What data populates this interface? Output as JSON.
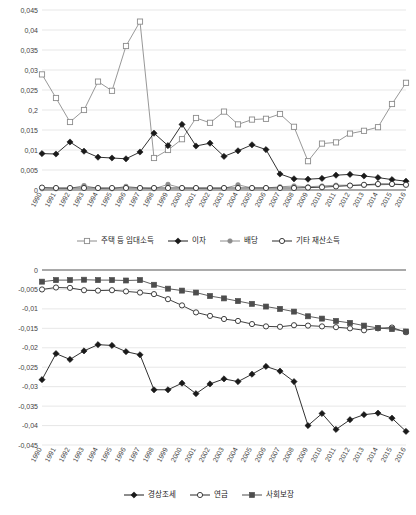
{
  "chart_data": [
    {
      "type": "line",
      "id": "property-income",
      "title": "",
      "xlabel": "",
      "ylabel": "",
      "grid": true,
      "legend_position": "bottom",
      "ylim": [
        0,
        0.045
      ],
      "ytick_values": [
        0,
        0.005,
        0.01,
        0.015,
        0.02,
        0.025,
        0.03,
        0.035,
        0.04,
        0.045
      ],
      "ytick_labels": [
        "0",
        "0,005",
        "0,01",
        "0,015",
        "0,2",
        "0,025",
        "0,03",
        "0,035",
        "0,04",
        "0,045"
      ],
      "categories": [
        "1990",
        "1991",
        "1992",
        "1993",
        "1994",
        "1995",
        "1996",
        "1997",
        "1998",
        "1999",
        "2000",
        "2001",
        "2002",
        "2003",
        "2004",
        "2005",
        "2006",
        "2007",
        "2008",
        "2009",
        "2010",
        "2011",
        "2012",
        "2013",
        "2014",
        "2015",
        "2016"
      ],
      "series": [
        {
          "name": "주택 등 임대소득",
          "marker": "open-square",
          "color": "#8c8c8c",
          "values": [
            0.0289,
            0.023,
            0.017,
            0.02,
            0.0271,
            0.0248,
            0.036,
            0.0421,
            0.008,
            0.01,
            0.0127,
            0.018,
            0.0168,
            0.0196,
            0.0164,
            0.0176,
            0.0178,
            0.019,
            0.0158,
            0.0072,
            0.0116,
            0.0119,
            0.0141,
            0.0148,
            0.0157,
            0.0215,
            0.0268
          ]
        },
        {
          "name": "이자",
          "marker": "filled-diamond",
          "color": "#1a1a1a",
          "values": [
            0.0091,
            0.009,
            0.012,
            0.0097,
            0.0082,
            0.008,
            0.0078,
            0.0095,
            0.0142,
            0.0111,
            0.0164,
            0.011,
            0.0117,
            0.0084,
            0.0098,
            0.0113,
            0.0101,
            0.004,
            0.0028,
            0.0027,
            0.0029,
            0.0037,
            0.0039,
            0.0035,
            0.0031,
            0.0026,
            0.0022
          ]
        },
        {
          "name": "배당",
          "marker": "filled-circle",
          "color": "#8c8c8c",
          "values": [
            0.0003,
            0.0003,
            0.0004,
            0.0011,
            0.0004,
            0.0003,
            0.0009,
            0.0005,
            0.0003,
            0.0014,
            0.0005,
            0.0004,
            0.0004,
            0.0004,
            0.0013,
            0.0005,
            0.0005,
            0.0008,
            0.001,
            0.0008,
            0.001,
            0.0012,
            0.0012,
            0.0012,
            0.0013,
            0.0014,
            0.0013
          ]
        },
        {
          "name": "기타 재산소득",
          "marker": "open-circle",
          "color": "#2b2b2b",
          "values": [
            0.0006,
            0.0005,
            0.0005,
            0.0005,
            0.0005,
            0.0005,
            0.0005,
            0.0005,
            0.0005,
            0.0005,
            0.0005,
            0.0005,
            0.0005,
            0.0005,
            0.0005,
            0.0005,
            0.0005,
            0.0005,
            0.0005,
            0.0006,
            0.0007,
            0.0009,
            0.0011,
            0.0013,
            0.0015,
            0.0015,
            0.0013
          ]
        }
      ]
    },
    {
      "type": "line",
      "id": "transfers-and-taxes",
      "title": "",
      "xlabel": "",
      "ylabel": "",
      "grid": true,
      "legend_position": "bottom",
      "ylim": [
        -0.045,
        0
      ],
      "ytick_values": [
        0,
        -0.005,
        -0.01,
        -0.015,
        -0.02,
        -0.025,
        -0.03,
        -0.035,
        -0.04,
        -0.045
      ],
      "ytick_labels": [
        "0",
        "-0,005",
        "-0,01",
        "-0,015",
        "-0,02",
        "-0,025",
        "-0,03",
        "-0,035",
        "-0,04",
        "-0,045"
      ],
      "categories": [
        "1990",
        "1991",
        "1992",
        "1993",
        "1994",
        "1995",
        "1996",
        "1997",
        "1998",
        "1999",
        "2000",
        "2001",
        "2002",
        "2003",
        "2004",
        "2005",
        "2006",
        "2007",
        "2008",
        "2009",
        "2010",
        "2011",
        "2012",
        "2013",
        "2014",
        "2015",
        "2016"
      ],
      "series": [
        {
          "name": "경상조세",
          "marker": "filled-diamond",
          "color": "#1a1a1a",
          "values": [
            -0.0282,
            -0.0215,
            -0.023,
            -0.0208,
            -0.0192,
            -0.0194,
            -0.021,
            -0.0218,
            -0.0308,
            -0.0308,
            -0.0291,
            -0.0318,
            -0.0293,
            -0.028,
            -0.0287,
            -0.0268,
            -0.0248,
            -0.026,
            -0.0287,
            -0.04,
            -0.0369,
            -0.041,
            -0.0385,
            -0.0372,
            -0.0368,
            -0.0381,
            -0.0415
          ]
        },
        {
          "name": "연금",
          "marker": "open-circle",
          "color": "#2b2b2b",
          "values": [
            -0.005,
            -0.0045,
            -0.0046,
            -0.0052,
            -0.0053,
            -0.0052,
            -0.0055,
            -0.0058,
            -0.0062,
            -0.0075,
            -0.0091,
            -0.0109,
            -0.0118,
            -0.0126,
            -0.0131,
            -0.0139,
            -0.0145,
            -0.0146,
            -0.0142,
            -0.0143,
            -0.0145,
            -0.0147,
            -0.015,
            -0.0155,
            -0.015,
            -0.0148,
            -0.016
          ]
        },
        {
          "name": "사회보장",
          "marker": "filled-square",
          "color": "#4d4d4d",
          "values": [
            -0.003,
            -0.0026,
            -0.0026,
            -0.0025,
            -0.0026,
            -0.0026,
            -0.0027,
            -0.0026,
            -0.0038,
            -0.0048,
            -0.0053,
            -0.0058,
            -0.0067,
            -0.0073,
            -0.008,
            -0.0087,
            -0.0094,
            -0.01,
            -0.0107,
            -0.0119,
            -0.0125,
            -0.0131,
            -0.0136,
            -0.0143,
            -0.0149,
            -0.0152,
            -0.0158
          ]
        }
      ]
    }
  ]
}
